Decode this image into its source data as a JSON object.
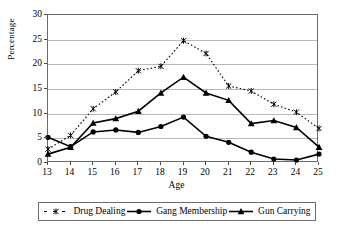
{
  "chart_data": {
    "type": "line",
    "title": "",
    "xlabel": "Age",
    "ylabel": "Percentage",
    "x": [
      13,
      14,
      15,
      16,
      17,
      18,
      19,
      20,
      21,
      22,
      23,
      24,
      25
    ],
    "xlim": [
      13,
      25
    ],
    "ylim": [
      0,
      30
    ],
    "yticks": [
      0,
      5,
      10,
      15,
      20,
      25,
      30
    ],
    "xticks": [
      13,
      14,
      15,
      16,
      17,
      18,
      19,
      20,
      21,
      22,
      23,
      24,
      25
    ],
    "grid": true,
    "legend_position": "below",
    "series": [
      {
        "name": "Drug Dealing",
        "marker": "x-asterisk",
        "linestyle": "dotted",
        "color": "#000000",
        "values": [
          2.8,
          5.6,
          11.0,
          14.4,
          18.7,
          19.6,
          24.8,
          22.2,
          15.6,
          14.6,
          11.9,
          10.3,
          7.0
        ]
      },
      {
        "name": "Gang Membership",
        "marker": "circle",
        "linestyle": "solid",
        "color": "#000000",
        "values": [
          5.2,
          3.3,
          6.3,
          6.7,
          6.2,
          7.4,
          9.3,
          5.4,
          4.2,
          2.2,
          0.8,
          0.6,
          1.8
        ]
      },
      {
        "name": "Gun Carrying",
        "marker": "triangle",
        "linestyle": "solid",
        "color": "#000000",
        "values": [
          1.8,
          3.2,
          8.1,
          9.0,
          10.5,
          14.2,
          17.4,
          14.2,
          12.7,
          8.0,
          8.6,
          7.2,
          3.2
        ]
      }
    ]
  },
  "axis": {
    "ylabel": "Percentage",
    "xlabel": "Age",
    "ytick_labels": [
      "30",
      "25",
      "20",
      "15",
      "10",
      "5",
      "0"
    ],
    "xtick_labels": [
      "13",
      "14",
      "15",
      "16",
      "17",
      "18",
      "19",
      "20",
      "21",
      "22",
      "23",
      "24",
      "25"
    ]
  },
  "legend": {
    "entries": [
      {
        "label": "Drug Dealing"
      },
      {
        "label": "Gang Membership"
      },
      {
        "label": "Gun Carrying"
      }
    ]
  },
  "colors": {
    "line": "#000000",
    "grid": "#b9b9b9",
    "frame": "#6b6b6b",
    "background": "#ffffff"
  }
}
